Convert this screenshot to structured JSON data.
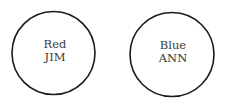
{
  "nodes": [
    {
      "color_label": "Red",
      "name": "JIM"
    },
    {
      "color_label": "Blue",
      "name": "ANN"
    }
  ]
}
